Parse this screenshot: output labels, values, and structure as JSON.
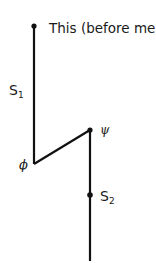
{
  "diagram": {
    "line_color": "#111111",
    "labels": {
      "top": "This (before me)",
      "s1_main": "S",
      "s1_sub": "1",
      "phi": "ϕ",
      "psi": "ψ",
      "s2_main": "S",
      "s2_sub": "2"
    },
    "points": {
      "top": {
        "x": 34,
        "y": 26
      },
      "phi": {
        "x": 34,
        "y": 164
      },
      "psi": {
        "x": 90,
        "y": 130
      },
      "s2": {
        "x": 90,
        "y": 195
      },
      "bottom": {
        "x": 90,
        "y": 261
      }
    }
  }
}
